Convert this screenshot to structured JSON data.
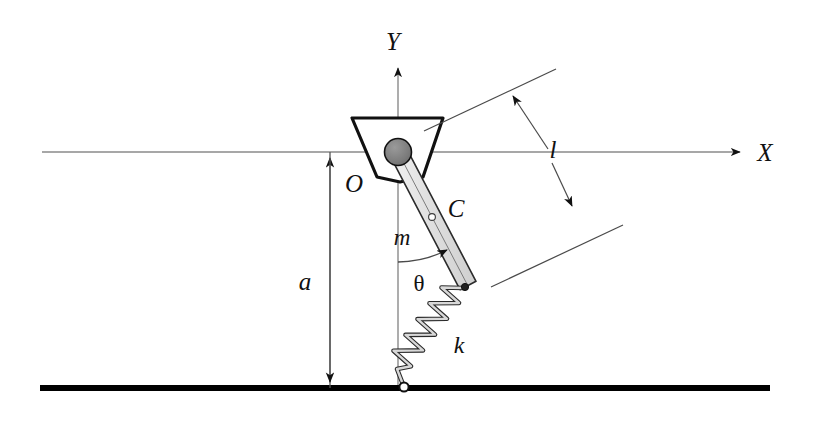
{
  "figure": {
    "labels": {
      "axis_x": "X",
      "axis_y": "Y",
      "origin": "O",
      "center_of_mass": "C",
      "mass": "m",
      "angle": "θ",
      "spring_constant": "k",
      "height": "a",
      "rod_length": "l"
    },
    "colors": {
      "axis": "#8a8a8a",
      "ground": "#000000",
      "rod_fill": "#e3e3e3",
      "rod_stroke": "#1a1a1a",
      "pivot_fill": "#7d7d7d",
      "pivot_stroke": "#111111",
      "bracket_stroke": "#111111",
      "spring_fill": "#d9d9d9",
      "spring_stroke": "#1a1a1a",
      "dimension": "#2a2a2a",
      "text": "#111111"
    },
    "geometry": {
      "x_axis_y": 152,
      "x_axis_start": 42,
      "x_axis_end": 747,
      "y_axis_x": 398,
      "y_axis_top": 62,
      "y_axis_bottom": 388,
      "ground_y": 388,
      "ground_start": 40,
      "ground_end": 770,
      "pivot": {
        "cx": 398,
        "cy": 152,
        "r": 13
      },
      "rod_start": {
        "x": 398,
        "y": 152
      },
      "rod_end": {
        "x": 468,
        "y": 286
      },
      "rod_half_width": 9,
      "com_marker": {
        "cx": 432,
        "cy": 217,
        "r": 3.2
      },
      "spring_top": {
        "x": 466,
        "y": 290
      },
      "spring_bottom": {
        "x": 404,
        "y": 387
      },
      "spring_coils": 8,
      "spring_amplitude": 17,
      "ground_anchor": {
        "cx": 404,
        "cy": 387,
        "r": 4.5
      },
      "dim_a": {
        "x": 330,
        "y_top": 152,
        "y_bottom": 388
      },
      "dim_l": {
        "upper_line": {
          "x1": 430,
          "y1": 128,
          "x2": 551,
          "y2": 72
        },
        "lower_line": {
          "x1": 497,
          "y1": 284,
          "x2": 617,
          "y2": 228
        },
        "arrow_from": {
          "x": 548,
          "y": 155
        },
        "arrow_to_upper": {
          "x": 511,
          "y": 92
        },
        "arrow_to_lower": {
          "x": 573,
          "y": 211
        }
      }
    },
    "label_positions": {
      "axis_x": {
        "x": 765,
        "y": 160
      },
      "axis_y": {
        "x": 390,
        "y": 50
      },
      "origin": {
        "x": 352,
        "y": 190
      },
      "center_of_mass": {
        "x": 450,
        "y": 216
      },
      "mass": {
        "x": 401,
        "y": 240
      },
      "angle": {
        "x": 417,
        "y": 288
      },
      "spring_constant": {
        "x": 456,
        "y": 351
      },
      "height": {
        "x": 303,
        "y": 288
      },
      "rod_length": {
        "x": 551,
        "y": 155
      }
    }
  }
}
